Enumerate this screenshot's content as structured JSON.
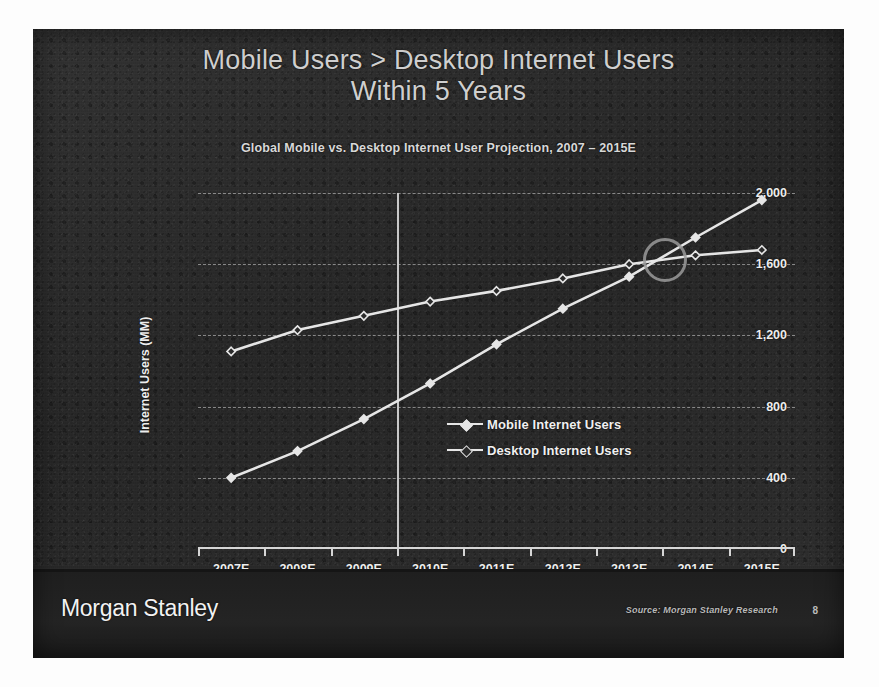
{
  "slide": {
    "title_line1": "Mobile Users > Desktop Internet Users",
    "title_line2": "Within 5 Years",
    "brand": "Morgan Stanley",
    "source": "Source: Morgan Stanley Research",
    "page_number": "8",
    "background_color": "#2b2b2b",
    "text_color": "#ededed"
  },
  "chart_data": {
    "type": "line",
    "title": "Global Mobile vs. Desktop Internet User Projection, 2007 – 2015E",
    "xlabel": "",
    "ylabel": "Internet Users (MM)",
    "categories": [
      "2007E",
      "2008E",
      "2009E",
      "2010E",
      "2011E",
      "2012E",
      "2013E",
      "2014E",
      "2015E"
    ],
    "series": [
      {
        "name": "Mobile Internet Users",
        "marker": "diamond-filled",
        "color": "#e6e6e6",
        "values": [
          400,
          550,
          730,
          930,
          1150,
          1350,
          1530,
          1750,
          1960
        ]
      },
      {
        "name": "Desktop Internet Users",
        "marker": "diamond-open",
        "color": "#e6e6e6",
        "values": [
          1110,
          1230,
          1310,
          1390,
          1450,
          1520,
          1600,
          1650,
          1680
        ]
      }
    ],
    "ylim": [
      0,
      2000
    ],
    "yticks": [
      0,
      400,
      800,
      1200,
      1600,
      2000
    ],
    "ytick_labels": [
      "0",
      "400",
      "800",
      "1,200",
      "1,600",
      "2,000"
    ],
    "grid": true,
    "grid_style": "dashed-horizontal",
    "legend_position": "center-right-inside",
    "annotations": [
      {
        "type": "vertical-line",
        "label": "actual / estimate divider",
        "x_between": [
          "2009E",
          "2010E"
        ]
      },
      {
        "type": "circle-highlight",
        "label": "crossover point",
        "near_x": "2013E-2014E",
        "near_y": 1640
      }
    ]
  }
}
